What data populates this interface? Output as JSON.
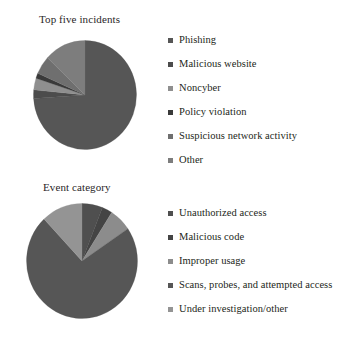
{
  "figure": {
    "background": "#ffffff",
    "text_color": "#231f20"
  },
  "chart_data": [
    {
      "type": "pie",
      "title": "Top five incidents",
      "categories": [
        "Phishing",
        "Malicious website",
        "Noncyber",
        "Policy violation",
        "Suspicious network activity",
        "Other"
      ],
      "values": [
        74.0,
        2.5,
        3.5,
        1.5,
        5.5,
        13.0
      ],
      "colors": [
        "#565656",
        "#4c4c4c",
        "#8f8f8f",
        "#3a3a3a",
        "#6f6f6f",
        "#7d7d7d"
      ],
      "legend_position": "right",
      "start_angle": 90,
      "direction": "clockwise",
      "grid": false,
      "xlabel": "",
      "ylabel": ""
    },
    {
      "type": "pie",
      "title": "Event category",
      "categories": [
        "Unauthorized access",
        "Malicious code",
        "Improper usage",
        "Scans, probes, and attempted access",
        "Under investigation/other"
      ],
      "values": [
        6.0,
        3.0,
        6.5,
        72.5,
        12.0
      ],
      "colors": [
        "#4f4f4f",
        "#444444",
        "#8c8c8c",
        "#565656",
        "#949494"
      ],
      "legend_position": "right",
      "start_angle": 90,
      "direction": "clockwise",
      "grid": false,
      "xlabel": "",
      "ylabel": ""
    }
  ],
  "charts": {
    "top": {
      "title": "Top five incidents",
      "legend": [
        {
          "label": "Phishing",
          "color": "#565656"
        },
        {
          "label": "Malicious website",
          "color": "#4c4c4c"
        },
        {
          "label": "Noncyber",
          "color": "#8f8f8f"
        },
        {
          "label": "Policy violation",
          "color": "#3a3a3a"
        },
        {
          "label": "Suspicious network activity",
          "color": "#6f6f6f"
        },
        {
          "label": "Other",
          "color": "#7d7d7d"
        }
      ]
    },
    "bottom": {
      "title": "Event category",
      "legend": [
        {
          "label": "Unauthorized access",
          "color": "#4f4f4f"
        },
        {
          "label": "Malicious code",
          "color": "#444444"
        },
        {
          "label": "Improper usage",
          "color": "#8c8c8c"
        },
        {
          "label": "Scans, probes, and attempted access",
          "color": "#565656"
        },
        {
          "label": "Under investigation/other",
          "color": "#949494"
        }
      ]
    }
  }
}
